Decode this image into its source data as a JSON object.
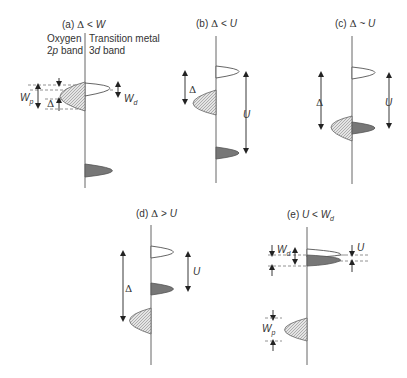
{
  "panels": {
    "a": {
      "title_prefix": "(a) ",
      "title_greek": "Δ",
      "title_rel": " < ",
      "title_sym": "W",
      "left_band_line1": "Oxygen",
      "left_band_line2_pre": "2",
      "left_band_line2_it": "p",
      "left_band_line2_post": " band",
      "right_band_line1": "Transition metal",
      "right_band_line2_pre": "3",
      "right_band_line2_it": "d",
      "right_band_line2_post": " band",
      "wp_sym": "W",
      "wp_sub": "p",
      "wd_sym": "W",
      "wd_sub": "d",
      "delta": "Δ"
    },
    "b": {
      "title_prefix": "(b) ",
      "title_greek": "Δ",
      "title_rel": " < ",
      "title_sym": "U",
      "delta": "Δ",
      "u": "U"
    },
    "c": {
      "title_prefix": "(c) ",
      "title_greek": "Δ",
      "title_rel": " ~ ",
      "title_sym": "U",
      "delta": "Δ",
      "u": "U"
    },
    "d": {
      "title_prefix": "(d) ",
      "title_greek": "Δ",
      "title_rel": " > ",
      "title_sym": "U",
      "delta": "Δ",
      "u": "U"
    },
    "e": {
      "title_prefix": "(e) ",
      "title_sym1": "U",
      "title_rel": " < ",
      "title_sym2": "W",
      "title_sub": "d",
      "wd_sym": "W",
      "wd_sub": "d",
      "wp_sym": "W",
      "wp_sub": "p",
      "u": "U"
    }
  }
}
